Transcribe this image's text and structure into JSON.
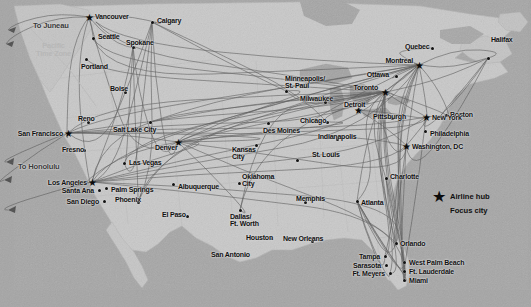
{
  "figure": {
    "type": "route-map",
    "width": 531,
    "height": 307,
    "land_color": "#c9c9c9",
    "water_color": "#a8a8a8",
    "route_color": "#4a4a4a",
    "marker_color": "#121212",
    "timezone_label_color": "#b7b7b7"
  },
  "legend": {
    "items": [
      {
        "symbol": "star",
        "label": "Airline hub"
      },
      {
        "symbol": "dot",
        "label": "Focus city"
      }
    ]
  },
  "annotations": [
    {
      "id": "pacific-time-zone",
      "text": "Pacific\nTime Zone",
      "x": 36,
      "y": 42
    },
    {
      "id": "to-juneau",
      "text": "To Juneau",
      "x": 33,
      "y": 22
    },
    {
      "id": "to-honolulu",
      "text": "To Honolulu",
      "x": 18,
      "y": 163
    }
  ],
  "cities": [
    {
      "name": "Vancouver",
      "type": "hub",
      "mx": 89,
      "my": 17,
      "lx": 95,
      "ly": 13,
      "align": "left"
    },
    {
      "name": "Calgary",
      "type": "focus",
      "mx": 152,
      "my": 22,
      "lx": 157,
      "ly": 17,
      "align": "left"
    },
    {
      "name": "Seattle",
      "type": "focus",
      "mx": 93,
      "my": 38,
      "lx": 98,
      "ly": 33,
      "align": "left"
    },
    {
      "name": "Spokane",
      "type": "focus",
      "mx": 133,
      "my": 47,
      "lx": 126,
      "ly": 39,
      "align": "left"
    },
    {
      "name": "Portland",
      "type": "focus",
      "mx": 86,
      "my": 59,
      "lx": 81,
      "ly": 63,
      "align": "left"
    },
    {
      "name": "Boise",
      "type": "focus",
      "mx": 125,
      "my": 92,
      "lx": 110,
      "ly": 85,
      "align": "left"
    },
    {
      "name": "Reno",
      "type": "focus",
      "mx": 88,
      "my": 122,
      "lx": 78,
      "ly": 115,
      "align": "left"
    },
    {
      "name": "Salt Lake City",
      "type": "focus",
      "mx": 150,
      "my": 122,
      "lx": 113,
      "ly": 126,
      "align": "left"
    },
    {
      "name": "San Francisco",
      "type": "hub",
      "mx": 68,
      "my": 133,
      "lx": 63,
      "ly": 130,
      "align": "right"
    },
    {
      "name": "Fresno",
      "type": "focus",
      "mx": 84,
      "my": 150,
      "lx": 62,
      "ly": 146,
      "align": "left"
    },
    {
      "name": "Las Vegas",
      "type": "focus",
      "mx": 124,
      "my": 163,
      "lx": 129,
      "ly": 159,
      "align": "left"
    },
    {
      "name": "Denver",
      "type": "hub",
      "mx": 178,
      "my": 142,
      "lx": 155,
      "ly": 144,
      "align": "left"
    },
    {
      "name": "Los Angeles",
      "type": "hub",
      "mx": 92,
      "my": 182,
      "lx": 87,
      "ly": 179,
      "align": "right"
    },
    {
      "name": "Santa Ana",
      "type": "focus",
      "mx": 99,
      "my": 190,
      "lx": 94,
      "ly": 187,
      "align": "right"
    },
    {
      "name": "Palm Springs",
      "type": "focus",
      "mx": 106,
      "my": 188,
      "lx": 111,
      "ly": 186,
      "align": "left"
    },
    {
      "name": "San Diego",
      "type": "focus",
      "mx": 104,
      "my": 201,
      "lx": 99,
      "ly": 198,
      "align": "right"
    },
    {
      "name": "Phoenix",
      "type": "focus",
      "mx": 138,
      "my": 202,
      "lx": 115,
      "ly": 196,
      "align": "left"
    },
    {
      "name": "Albuquerque",
      "type": "focus",
      "mx": 173,
      "my": 184,
      "lx": 178,
      "ly": 183,
      "align": "left"
    },
    {
      "name": "El Paso",
      "type": "focus",
      "mx": 187,
      "my": 216,
      "lx": 162,
      "ly": 211,
      "align": "left"
    },
    {
      "name": "Kansas\nCity",
      "type": "focus",
      "mx": 256,
      "my": 145,
      "lx": 232,
      "ly": 146,
      "align": "left"
    },
    {
      "name": "Des Moines",
      "type": "focus",
      "mx": 268,
      "my": 123,
      "lx": 263,
      "ly": 127,
      "align": "left"
    },
    {
      "name": "Oklahoma\nCity",
      "type": "focus",
      "mx": 239,
      "my": 183,
      "lx": 242,
      "ly": 173,
      "align": "left"
    },
    {
      "name": "Dallas/\nFt. Worth",
      "type": "focus",
      "mx": 240,
      "my": 210,
      "lx": 230,
      "ly": 213,
      "align": "left"
    },
    {
      "name": "Houston",
      "type": "focus",
      "mx": 271,
      "my": 238,
      "lx": 246,
      "ly": 234,
      "align": "left"
    },
    {
      "name": "San Antonio",
      "type": "focus",
      "mx": 245,
      "my": 255,
      "lx": 211,
      "ly": 251,
      "align": "left"
    },
    {
      "name": "New Orleans",
      "type": "focus",
      "mx": 312,
      "my": 241,
      "lx": 283,
      "ly": 235,
      "align": "left"
    },
    {
      "name": "Memphis",
      "type": "focus",
      "mx": 305,
      "my": 202,
      "lx": 296,
      "ly": 195,
      "align": "left"
    },
    {
      "name": "St. Louis",
      "type": "focus",
      "mx": 297,
      "my": 160,
      "lx": 312,
      "ly": 151,
      "align": "left"
    },
    {
      "name": "Chicago",
      "type": "focus",
      "mx": 327,
      "my": 122,
      "lx": 300,
      "ly": 117,
      "align": "left"
    },
    {
      "name": "Milwaukee",
      "type": "focus",
      "mx": 325,
      "my": 102,
      "lx": 300,
      "ly": 95,
      "align": "left"
    },
    {
      "name": "Minneapolis/\nSt. Paul",
      "type": "focus",
      "mx": 286,
      "my": 91,
      "lx": 285,
      "ly": 75,
      "align": "left"
    },
    {
      "name": "Indianapolis",
      "type": "focus",
      "mx": 337,
      "my": 139,
      "lx": 318,
      "ly": 133,
      "align": "left"
    },
    {
      "name": "Detroit",
      "type": "hub",
      "mx": 358,
      "my": 110,
      "lx": 344,
      "ly": 101,
      "align": "left"
    },
    {
      "name": "Toronto",
      "type": "hub",
      "mx": 385,
      "my": 92,
      "lx": 378,
      "ly": 84,
      "align": "right"
    },
    {
      "name": "Ottawa",
      "type": "focus",
      "mx": 396,
      "my": 76,
      "lx": 389,
      "ly": 71,
      "align": "right"
    },
    {
      "name": "Montreal",
      "type": "hub",
      "mx": 419,
      "my": 65,
      "lx": 413,
      "ly": 57,
      "align": "right"
    },
    {
      "name": "Quebec",
      "type": "focus",
      "mx": 432,
      "my": 48,
      "lx": 405,
      "ly": 43,
      "align": "left"
    },
    {
      "name": "Halifax",
      "type": "focus",
      "mx": 488,
      "my": 58,
      "lx": 491,
      "ly": 36,
      "align": "left"
    },
    {
      "name": "Boston",
      "type": "focus",
      "mx": 446,
      "my": 115,
      "lx": 450,
      "ly": 111,
      "align": "left"
    },
    {
      "name": "New York",
      "type": "hub",
      "mx": 426,
      "my": 117,
      "lx": 432,
      "ly": 114,
      "align": "left"
    },
    {
      "name": "Philadelphia",
      "type": "focus",
      "mx": 425,
      "my": 131,
      "lx": 430,
      "ly": 130,
      "align": "left"
    },
    {
      "name": "Washington, DC",
      "type": "hub",
      "mx": 406,
      "my": 146,
      "lx": 412,
      "ly": 143,
      "align": "left"
    },
    {
      "name": "Pittsburgh",
      "type": "focus",
      "mx": 392,
      "my": 118,
      "lx": 373,
      "ly": 113,
      "align": "left"
    },
    {
      "name": "Charlotte",
      "type": "focus",
      "mx": 386,
      "my": 178,
      "lx": 390,
      "ly": 173,
      "align": "left"
    },
    {
      "name": "Atlanta",
      "type": "focus",
      "mx": 357,
      "my": 201,
      "lx": 361,
      "ly": 199,
      "align": "left"
    },
    {
      "name": "Orlando",
      "type": "focus",
      "mx": 396,
      "my": 243,
      "lx": 400,
      "ly": 240,
      "align": "left"
    },
    {
      "name": "Tampa",
      "type": "focus",
      "mx": 385,
      "my": 256,
      "lx": 380,
      "ly": 253,
      "align": "right"
    },
    {
      "name": "Sarasota",
      "type": "focus",
      "mx": 386,
      "my": 265,
      "lx": 381,
      "ly": 262,
      "align": "right"
    },
    {
      "name": "Ft. Meyers",
      "type": "focus",
      "mx": 390,
      "my": 273,
      "lx": 385,
      "ly": 270,
      "align": "right"
    },
    {
      "name": "West Palm Beach",
      "type": "focus",
      "mx": 404,
      "my": 262,
      "lx": 409,
      "ly": 259,
      "align": "left"
    },
    {
      "name": "Ft. Lauderdale",
      "type": "focus",
      "mx": 404,
      "my": 271,
      "lx": 409,
      "ly": 268,
      "align": "left"
    },
    {
      "name": "Miami",
      "type": "focus",
      "mx": 404,
      "my": 280,
      "lx": 409,
      "ly": 277,
      "align": "left"
    }
  ],
  "hub_nodes": {
    "vancouver": [
      89,
      17
    ],
    "san_francisco": [
      68,
      133
    ],
    "los_angeles": [
      92,
      182
    ],
    "denver": [
      178,
      142
    ],
    "detroit": [
      358,
      110
    ],
    "toronto": [
      385,
      92
    ],
    "montreal": [
      419,
      65
    ],
    "new_york": [
      426,
      117
    ],
    "washington": [
      406,
      146
    ]
  }
}
